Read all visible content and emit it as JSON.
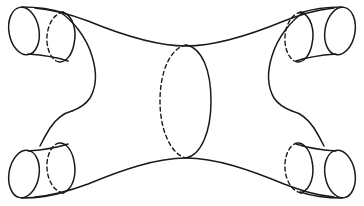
{
  "figure": {
    "type": "line-drawing",
    "background_color": "#ffffff",
    "stroke_color": "#1a1a1a",
    "stroke_width": 1.5,
    "dashed_pattern": "4 3.2",
    "canvas": {
      "width": 364,
      "height": 206
    }
  },
  "geometry": {
    "cuffs": [
      {
        "name": "top-left-cuff",
        "position": "top-left",
        "rim_ellipse": {
          "cx": 23,
          "cy": 30,
          "rx": 15,
          "ry": 24,
          "rotate": -12
        },
        "inner_ellipse": {
          "cx": 60,
          "cy": 37,
          "rx": 14,
          "ry": 25,
          "rotate": -12
        },
        "hidden_arc": "left"
      },
      {
        "name": "top-right-cuff",
        "position": "top-right",
        "rim_ellipse": {
          "cx": 341,
          "cy": 30,
          "rx": 15,
          "ry": 24,
          "rotate": 12
        },
        "inner_ellipse": {
          "cx": 304,
          "cy": 37,
          "rx": 14,
          "ry": 25,
          "rotate": 12
        },
        "hidden_arc": "left"
      },
      {
        "name": "bottom-left-cuff",
        "position": "bottom-left",
        "rim_ellipse": {
          "cx": 23,
          "cy": 176,
          "rx": 15,
          "ry": 24,
          "rotate": 12
        },
        "inner_ellipse": {
          "cx": 60,
          "cy": 169,
          "rx": 14,
          "ry": 25,
          "rotate": 12
        },
        "hidden_arc": "left"
      },
      {
        "name": "bottom-right-cuff",
        "position": "bottom-right",
        "rim_ellipse": {
          "cx": 341,
          "cy": 176,
          "rx": 15,
          "ry": 24,
          "rotate": -12
        },
        "inner_ellipse": {
          "cx": 304,
          "cy": 169,
          "rx": 14,
          "ry": 25,
          "rotate": -12
        },
        "hidden_arc": "left"
      }
    ],
    "separating_curve": {
      "name": "central-separating-curve",
      "cx": 185,
      "cy": 101,
      "rx": 25,
      "ry": 57,
      "front_arc": "right-solid",
      "back_arc": "left-dashed"
    },
    "waists": [
      {
        "name": "left-waist",
        "side": "left",
        "shape": "s-curve",
        "neck_x": 88,
        "neck_y": 101
      },
      {
        "name": "right-waist",
        "side": "right",
        "shape": "s-curve",
        "neck_x": 276,
        "neck_y": 101
      }
    ],
    "spanning_edges": [
      {
        "name": "top-edge",
        "from_x": 74,
        "from_y": 18,
        "to_x": 290,
        "to_y": 18,
        "sag_y": 47
      },
      {
        "name": "bottom-edge",
        "from_x": 74,
        "from_y": 188,
        "to_x": 290,
        "to_y": 188,
        "sag_y": 158
      }
    ]
  }
}
